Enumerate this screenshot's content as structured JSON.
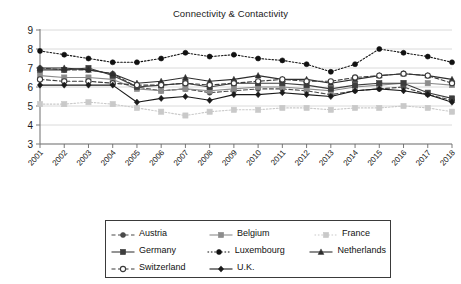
{
  "chart_data": {
    "type": "line",
    "title": "Connectivity & Contactivity",
    "xlabel": "",
    "ylabel": "",
    "ylim": [
      3,
      9
    ],
    "yticks": [
      3,
      4,
      5,
      6,
      7,
      8,
      9
    ],
    "grid": true,
    "legend_position": "bottom",
    "categories": [
      "2001",
      "2002",
      "2003",
      "2004",
      "2005",
      "2006",
      "2007",
      "2008",
      "2009",
      "2010",
      "2011",
      "2012",
      "2013",
      "2014",
      "2015",
      "2016",
      "2017",
      "2018"
    ],
    "series": [
      {
        "name": "Austria",
        "color": "#4a4a4a",
        "marker": "circle",
        "dash": "dashed",
        "values": [
          7.0,
          6.9,
          6.9,
          6.7,
          6.0,
          5.8,
          5.9,
          5.7,
          5.8,
          5.9,
          5.9,
          5.8,
          5.6,
          5.8,
          5.9,
          6.0,
          5.6,
          5.3
        ]
      },
      {
        "name": "Belgium",
        "color": "#8c8c8c",
        "marker": "square",
        "dash": "solid",
        "values": [
          6.6,
          6.5,
          6.5,
          6.4,
          5.9,
          5.8,
          5.9,
          5.8,
          5.9,
          6.0,
          6.0,
          5.9,
          5.8,
          6.0,
          6.1,
          6.2,
          6.2,
          6.1
        ]
      },
      {
        "name": "France",
        "color": "#c9c9c9",
        "marker": "square",
        "dash": "dotted",
        "values": [
          5.1,
          5.1,
          5.2,
          5.1,
          4.9,
          4.7,
          4.5,
          4.7,
          4.8,
          4.8,
          4.9,
          4.9,
          4.8,
          4.9,
          4.9,
          5.0,
          4.9,
          4.7
        ]
      },
      {
        "name": "Germany",
        "color": "#3d3d3d",
        "marker": "square",
        "dash": "solid",
        "values": [
          6.9,
          6.9,
          7.0,
          6.6,
          6.0,
          6.1,
          6.2,
          6.0,
          6.2,
          6.2,
          6.2,
          6.1,
          5.9,
          6.1,
          6.2,
          6.2,
          5.7,
          5.4
        ]
      },
      {
        "name": "Luxembourg",
        "color": "#111111",
        "marker": "circle",
        "dash": "dotted",
        "values": [
          7.9,
          7.7,
          7.5,
          7.3,
          7.3,
          7.5,
          7.8,
          7.6,
          7.7,
          7.5,
          7.4,
          7.2,
          6.8,
          7.2,
          8.0,
          7.8,
          7.6,
          7.3
        ]
      },
      {
        "name": "Netherlands",
        "color": "#2e2e2e",
        "marker": "triangle",
        "dash": "solid",
        "values": [
          7.0,
          7.0,
          6.9,
          6.7,
          6.2,
          6.3,
          6.5,
          6.3,
          6.4,
          6.6,
          6.4,
          6.4,
          6.2,
          6.4,
          6.6,
          6.7,
          6.6,
          6.4
        ]
      },
      {
        "name": "Switzerland",
        "color": "#3a3a3a",
        "marker": "open-circle",
        "dash": "dashed",
        "values": [
          6.4,
          6.3,
          6.3,
          6.2,
          6.1,
          6.1,
          6.2,
          6.1,
          6.2,
          6.3,
          6.4,
          6.3,
          6.3,
          6.5,
          6.6,
          6.7,
          6.6,
          6.2
        ]
      },
      {
        "name": "U.K.",
        "color": "#1a1a1a",
        "marker": "diamond",
        "dash": "solid",
        "values": [
          6.1,
          6.1,
          6.1,
          6.1,
          5.2,
          5.4,
          5.5,
          5.3,
          5.6,
          5.6,
          5.7,
          5.6,
          5.5,
          5.8,
          5.9,
          5.8,
          5.6,
          5.2
        ]
      }
    ]
  },
  "legend": {
    "rows": [
      [
        {
          "name": "Austria",
          "key_index": 0
        },
        {
          "name": "Belgium",
          "key_index": 1
        },
        {
          "name": "France",
          "key_index": 2
        }
      ],
      [
        {
          "name": "Germany",
          "key_index": 3
        },
        {
          "name": "Luxembourg",
          "key_index": 4
        },
        {
          "name": "Netherlands",
          "key_index": 5
        }
      ],
      [
        {
          "name": "Switzerland",
          "key_index": 6
        },
        {
          "name": "U.K.",
          "key_index": 7
        }
      ]
    ]
  }
}
